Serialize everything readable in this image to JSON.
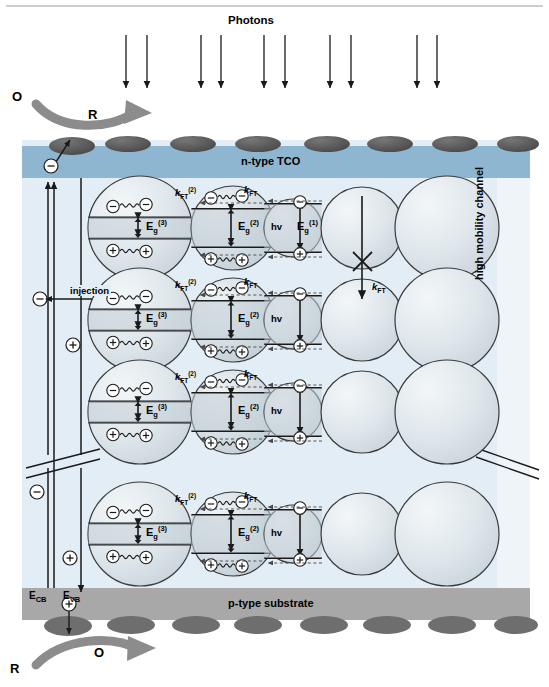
{
  "figure": {
    "top_label": "Photons",
    "layers": {
      "tco": "n-type TCO",
      "substrate": "p-type substrate",
      "channel": "high mobility channel"
    },
    "redox_top": {
      "oxidized": "O",
      "reduced": "R"
    },
    "redox_bottom": {
      "reduced": "R",
      "oxidized": "O"
    },
    "band_labels": {
      "cb": "E",
      "cb_sub": "CB",
      "vb": "E",
      "vb_sub": "VB"
    },
    "injection_label": "injection",
    "rate_labels": {
      "kft2_base": "k",
      "kft2_sub": "FT",
      "kft2_sup": "(2)",
      "kft_base": "k",
      "kft_sub": "FT",
      "kft_blocked_base": "k",
      "kft_blocked_sub": "FT"
    },
    "energy_labels": {
      "eg3_base": "E",
      "eg3_sub": "g",
      "eg3_sup": "(3)",
      "eg2_base": "E",
      "eg2_sub": "g",
      "eg2_sup": "(2)",
      "eg1_base": "E",
      "eg1_sub": "g",
      "eg1_sup": "(1)",
      "photon": "hv"
    },
    "carriers": {
      "electron": "−",
      "hole": "+"
    },
    "colors": {
      "tco_blue": "#8fb6d1",
      "panel_blue": "#e3edf5",
      "substrate_gray": "#a8a8a8",
      "bump_gray": "#595959",
      "bump_gray_bottom": "#6e6e6e",
      "qd_fill_light": "#e8eef2",
      "qd_fill_mid": "#ccd6dd",
      "qd_fill_band": "#c2ced6",
      "arrow_gray": "#8c8c8c",
      "line_black": "#1a1a1a"
    },
    "counts": {
      "photon_pairs": 5,
      "qd_rows": 4,
      "qd_per_row": 5,
      "top_bumps": 8,
      "bottom_bumps": 8
    },
    "rows": [
      {
        "id": "row-1",
        "has_eg1": true,
        "has_blocked_kft": true
      },
      {
        "id": "row-2",
        "has_eg1": false,
        "has_blocked_kft": false
      },
      {
        "id": "row-3",
        "has_eg1": false,
        "has_blocked_kft": false
      },
      {
        "id": "row-4",
        "has_eg1": false,
        "has_blocked_kft": false
      }
    ]
  }
}
